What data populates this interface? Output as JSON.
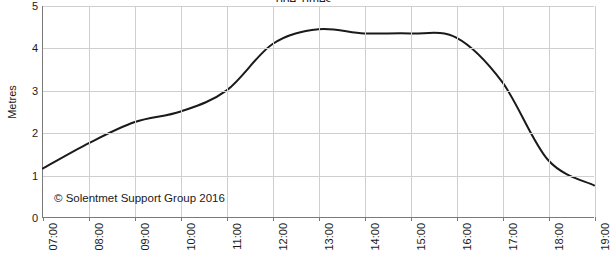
{
  "chart_data": {
    "type": "line",
    "title": "Tide Times",
    "xlabel": "",
    "ylabel": "Metres",
    "xlim": [
      "07:00",
      "19:00"
    ],
    "ylim": [
      0,
      5
    ],
    "yticks": [
      0,
      1,
      2,
      3,
      4,
      5
    ],
    "grid": true,
    "legend": "none",
    "line_color": "#1a1a1a",
    "grid_color": "#cfcfcf",
    "axis_color": "#7a7a7a",
    "categories": [
      "07:00",
      "08:00",
      "09:00",
      "10:00",
      "11:00",
      "12:00",
      "13:00",
      "14:00",
      "15:00",
      "16:00",
      "17:00",
      "18:00",
      "19:00"
    ],
    "series": [
      {
        "name": "Tide height",
        "values": [
          1.15,
          1.75,
          2.25,
          2.5,
          3.0,
          4.1,
          4.45,
          4.35,
          4.35,
          4.25,
          3.2,
          1.35,
          0.75
        ]
      }
    ],
    "annotation": "© Solentmet Support Group 2016"
  }
}
